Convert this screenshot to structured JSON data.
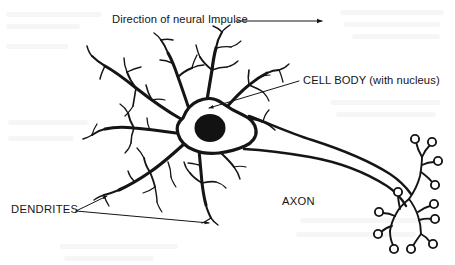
{
  "figure": {
    "background_color": "#ffffff",
    "ink_color": "#151515",
    "width": 455,
    "height": 265
  },
  "labels": {
    "impulse": "Direction of neural Impulse",
    "cell_body": "CELL BODY (with nucleus)",
    "dendrites": "DENDRITES",
    "axon": "AXON"
  },
  "annotations": {
    "impulse_arrow": "horizontal-arrow-right",
    "cell_body_leader": "diagonal-arrow-to-nucleus",
    "dendrites_leader": "two-arrows-to-dendrite-tips",
    "axon_leader": "none"
  },
  "parts": {
    "soma": "cell-body",
    "nucleus": "nucleus",
    "dendrites": "dendrite-tree",
    "axon": "axon-trunk",
    "terminals": "axon-terminal-knobs",
    "terminal_count": 11
  }
}
